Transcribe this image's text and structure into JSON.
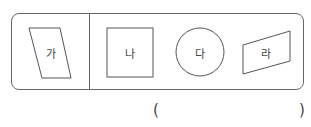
{
  "figures": [
    {
      "label": "가",
      "shape": "parallelogram"
    },
    {
      "label": "나",
      "shape": "square"
    },
    {
      "label": "다",
      "shape": "circle"
    },
    {
      "label": "라",
      "shape": "trapezoid"
    }
  ],
  "answer": {
    "open": "(",
    "close": ")",
    "value": ""
  }
}
